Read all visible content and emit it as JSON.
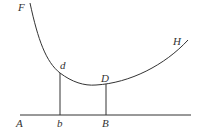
{
  "diagram": {
    "labels": {
      "F": "F",
      "H": "H",
      "d": "d",
      "D": "D",
      "A": "A",
      "b": "b",
      "B": "B"
    },
    "colors": {
      "stroke": "#333333",
      "background": "#ffffff"
    }
  }
}
